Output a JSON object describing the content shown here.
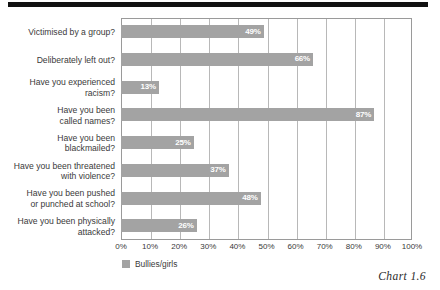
{
  "chart_data": {
    "type": "bar",
    "orientation": "horizontal",
    "title": "",
    "xlabel": "",
    "ylabel": "",
    "xlim": [
      0,
      100
    ],
    "xticks": [
      "0%",
      "10%",
      "20%",
      "30%",
      "40%",
      "50%",
      "60%",
      "70%",
      "80%",
      "90%",
      "100%"
    ],
    "grid": true,
    "legend_position": "bottom-left",
    "categories": [
      "Victimised by a group?",
      "Deliberately left out?",
      "Have you experienced\nracism?",
      "Have you been\ncalled names?",
      "Have you been\nblackmailed?",
      "Have you been threatened\nwith violence?",
      "Have you been pushed\nor punched at school?",
      "Have you been physically\nattacked?"
    ],
    "series": [
      {
        "name": "Bullies/girls",
        "color": "#a3a3a3",
        "values": [
          49,
          66,
          13,
          87,
          25,
          37,
          48,
          26
        ],
        "value_labels": [
          "49%",
          "66%",
          "13%",
          "87%",
          "25%",
          "37%",
          "48%",
          "26%"
        ]
      }
    ]
  },
  "caption": "Chart 1.6",
  "legend": {
    "label": "Bullies/girls",
    "swatch_color": "#a3a3a3"
  }
}
